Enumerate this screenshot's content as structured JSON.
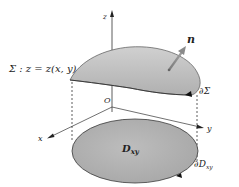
{
  "diagram": {
    "labels": {
      "surface": "Σ : z = z(x, y)",
      "normal": "n",
      "surface_boundary": "∂Σ",
      "origin": "O",
      "x_axis": "x",
      "y_axis": "y",
      "z_axis": "z",
      "region": "D",
      "region_sub": "xy",
      "region_boundary": "∂D",
      "region_boundary_sub": "xy"
    },
    "colors": {
      "surface_fill": "#bdbdbd",
      "surface_edge": "#555555",
      "region_fill": "#b3b3b3",
      "region_edge": "#444444",
      "normal_arrow": "#8a8a8a",
      "axis": "#333333"
    }
  }
}
